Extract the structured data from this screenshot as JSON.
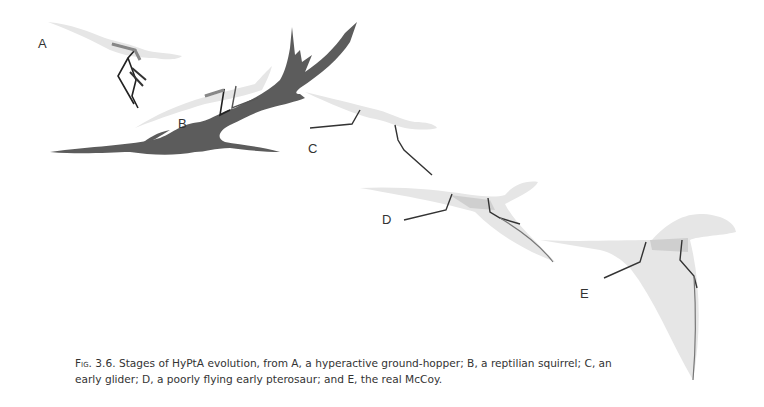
{
  "figure": {
    "panels": [
      {
        "id": "A",
        "label": "A"
      },
      {
        "id": "B",
        "label": "B"
      },
      {
        "id": "C",
        "label": "C"
      },
      {
        "id": "D",
        "label": "D"
      },
      {
        "id": "E",
        "label": "E"
      }
    ],
    "colors": {
      "branch": "#5c5c5c",
      "body_light": "#e4e4e4",
      "body_mid": "#cfcfcf",
      "limb_dark": "#222222",
      "limb_outline": "#777777"
    }
  },
  "caption": {
    "fig_number": "Fig. 3.6.",
    "text": "Stages of HyPtA evolution, from A, a hyperactive ground-hopper; B, a reptilian squirrel; C, an early glider; D, a poorly flying early pterosaur; and E, the real McCoy."
  }
}
